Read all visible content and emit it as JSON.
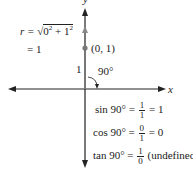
{
  "axes": {
    "x_label": "x",
    "y_label": "y"
  },
  "point": {
    "label": "(0, 1)",
    "x": 0,
    "y": 1
  },
  "segment_label": "1",
  "angle_label": "90°",
  "radius": {
    "line1_prefix": "r = ",
    "line1_radicand_a": "0",
    "line1_exp_a": "2",
    "line1_plus": " + 1",
    "line1_exp_b": "2",
    "line2": "= 1"
  },
  "equations": [
    {
      "lhs": "sin 90° = ",
      "num": "1",
      "den": "1",
      "rhs": " = 1"
    },
    {
      "lhs": "cos 90° = ",
      "num": "0",
      "den": "1",
      "rhs": " = 0"
    },
    {
      "lhs": "tan 90° = ",
      "num": "1",
      "den": "0",
      "rhs": " (undefined)"
    }
  ],
  "colors": {
    "axis": "#222222",
    "vector": "#777777",
    "point": "#777777"
  }
}
